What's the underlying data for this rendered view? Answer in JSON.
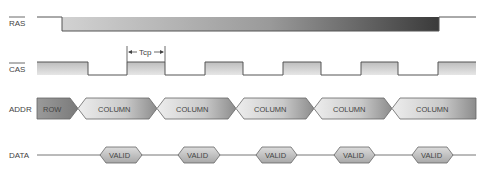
{
  "signals": {
    "ras": {
      "label": "RAS",
      "overbar": true
    },
    "cas": {
      "label": "CAS",
      "overbar": true
    },
    "addr": {
      "label": "ADDR"
    },
    "data": {
      "label": "DATA"
    }
  },
  "annotations": {
    "tcp": {
      "label": "Tcp"
    }
  },
  "addr_cells": [
    {
      "label": "ROW"
    },
    {
      "label": "COLUMN"
    },
    {
      "label": "COLUMN"
    },
    {
      "label": "COLUMN"
    },
    {
      "label": "COLUMN"
    },
    {
      "label": "COLUMN"
    }
  ],
  "data_cells": [
    {
      "label": "VALID"
    },
    {
      "label": "VALID"
    },
    {
      "label": "VALID"
    },
    {
      "label": "VALID"
    },
    {
      "label": "VALID"
    }
  ],
  "colors": {
    "line": "#555555",
    "ras_gradient_start": "#cfcfcf",
    "ras_gradient_end": "#3a3a3a",
    "cas_fill": "#d6d6d6",
    "cell_light": "#e2e2e2",
    "cell_dark": "#8a8a8a"
  }
}
